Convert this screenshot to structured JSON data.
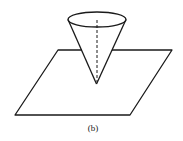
{
  "figure": {
    "caption": "(b)",
    "colors": {
      "line": "#1a1a1a",
      "background": "#ffffff"
    }
  }
}
